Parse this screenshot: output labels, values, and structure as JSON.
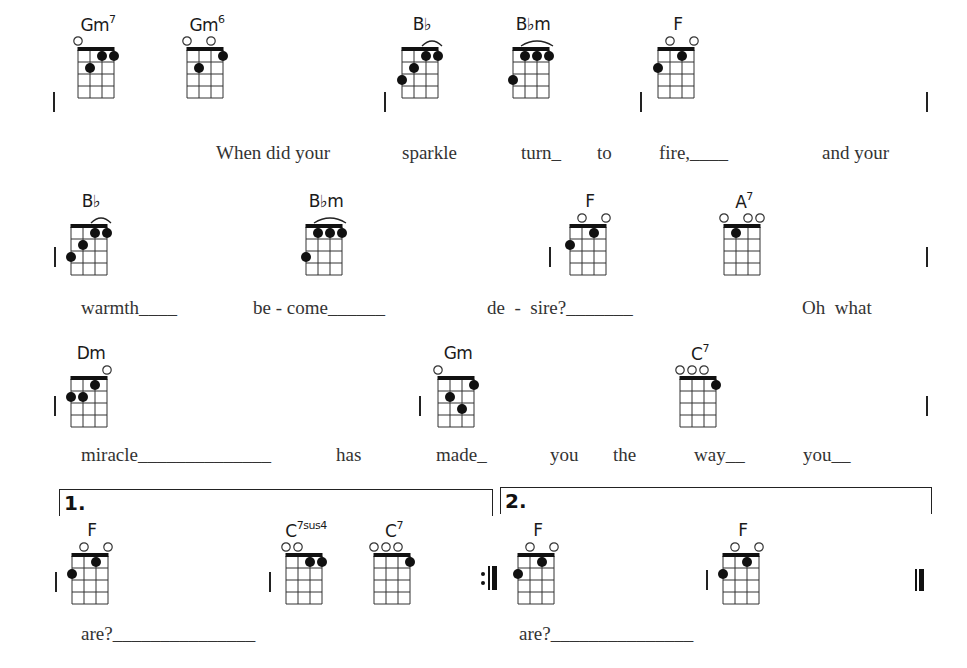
{
  "strings": [
    "G",
    "C",
    "E",
    "A"
  ],
  "chords": [
    {
      "id": "c1",
      "name": "Gm",
      "sup": "7",
      "x": 68,
      "y": 14,
      "frets": [
        0,
        2,
        1,
        1
      ],
      "arc": null
    },
    {
      "id": "c2",
      "name": "Gm",
      "sup": "6",
      "x": 177,
      "y": 14,
      "frets": [
        0,
        2,
        0,
        1
      ],
      "arc": null
    },
    {
      "id": "c3",
      "name": "B♭",
      "sup": "",
      "x": 392,
      "y": 14,
      "frets": [
        3,
        2,
        1,
        1
      ],
      "arc": [
        2,
        3
      ]
    },
    {
      "id": "c4",
      "name": "B♭m",
      "sup": "",
      "x": 503,
      "y": 14,
      "frets": [
        3,
        1,
        1,
        1
      ],
      "arc": [
        1,
        3
      ]
    },
    {
      "id": "c5",
      "name": "F",
      "sup": "",
      "x": 648,
      "y": 14,
      "frets": [
        2,
        0,
        1,
        0
      ],
      "arc": null
    },
    {
      "id": "c6",
      "name": "B♭",
      "sup": "",
      "x": 61,
      "y": 191,
      "frets": [
        3,
        2,
        1,
        1
      ],
      "arc": [
        2,
        3
      ]
    },
    {
      "id": "c7",
      "name": "B♭m",
      "sup": "",
      "x": 296,
      "y": 191,
      "frets": [
        3,
        1,
        1,
        1
      ],
      "arc": [
        1,
        3
      ]
    },
    {
      "id": "c8",
      "name": "F",
      "sup": "",
      "x": 560,
      "y": 191,
      "frets": [
        2,
        0,
        1,
        0
      ],
      "arc": null
    },
    {
      "id": "c9",
      "name": "A",
      "sup": "7",
      "x": 714,
      "y": 191,
      "frets": [
        0,
        1,
        0,
        0
      ],
      "arc": null
    },
    {
      "id": "c10",
      "name": "Dm",
      "sup": "",
      "x": 61,
      "y": 343,
      "frets": [
        2,
        2,
        1,
        0
      ],
      "arc": null
    },
    {
      "id": "c11",
      "name": "Gm",
      "sup": "",
      "x": 428,
      "y": 343,
      "frets": [
        0,
        2,
        3,
        1
      ],
      "arc": null
    },
    {
      "id": "c12",
      "name": "C",
      "sup": "7",
      "x": 670,
      "y": 343,
      "frets": [
        0,
        0,
        0,
        1
      ],
      "arc": null
    },
    {
      "id": "c13",
      "name": "F",
      "sup": "",
      "x": 62,
      "y": 520,
      "frets": [
        2,
        0,
        1,
        0
      ],
      "arc": null
    },
    {
      "id": "c14",
      "name": "C",
      "sup": "7sus4",
      "x": 276,
      "y": 520,
      "frets": [
        0,
        0,
        1,
        1
      ],
      "arc": null
    },
    {
      "id": "c15",
      "name": "C",
      "sup": "7",
      "x": 364,
      "y": 520,
      "frets": [
        0,
        0,
        0,
        1
      ],
      "arc": null
    },
    {
      "id": "c16",
      "name": "F",
      "sup": "",
      "x": 508,
      "y": 520,
      "frets": [
        2,
        0,
        1,
        0
      ],
      "arc": null
    },
    {
      "id": "c17",
      "name": "F",
      "sup": "",
      "x": 713,
      "y": 520,
      "frets": [
        2,
        0,
        1,
        0
      ],
      "arc": null
    }
  ],
  "lyrics": {
    "line1": [
      {
        "text": "When did your",
        "x": 216,
        "y": 142
      },
      {
        "text": "sparkle",
        "x": 402,
        "y": 142
      },
      {
        "text": "turn_",
        "x": 521,
        "y": 142
      },
      {
        "text": "to",
        "x": 597,
        "y": 142
      },
      {
        "text": "fire,____",
        "x": 659,
        "y": 142
      },
      {
        "text": "and your",
        "x": 822,
        "y": 142
      }
    ],
    "line2": [
      {
        "text": "warmth____",
        "x": 81,
        "y": 297
      },
      {
        "text": "be - come______",
        "x": 253,
        "y": 297
      },
      {
        "text": "de  -  sire?_______",
        "x": 487,
        "y": 297
      },
      {
        "text": "Oh  what",
        "x": 802,
        "y": 297
      }
    ],
    "line3": [
      {
        "text": "miracle______________",
        "x": 81,
        "y": 444
      },
      {
        "text": "has",
        "x": 336,
        "y": 444
      },
      {
        "text": "made_",
        "x": 436,
        "y": 444
      },
      {
        "text": "you",
        "x": 550,
        "y": 444
      },
      {
        "text": "the",
        "x": 613,
        "y": 444
      },
      {
        "text": "way__",
        "x": 694,
        "y": 444
      },
      {
        "text": "you__",
        "x": 803,
        "y": 444
      }
    ],
    "line4": [
      {
        "text": "are?_______________",
        "x": 81,
        "y": 623
      },
      {
        "text": "are?_______________",
        "x": 519,
        "y": 623
      }
    ]
  },
  "barlines": [
    {
      "x": 53,
      "y": 92
    },
    {
      "x": 384,
      "y": 92
    },
    {
      "x": 640,
      "y": 92
    },
    {
      "x": 926,
      "y": 92
    },
    {
      "x": 54,
      "y": 247
    },
    {
      "x": 549,
      "y": 247
    },
    {
      "x": 926,
      "y": 247
    },
    {
      "x": 54,
      "y": 396
    },
    {
      "x": 419,
      "y": 396
    },
    {
      "x": 926,
      "y": 396
    },
    {
      "x": 55,
      "y": 572
    },
    {
      "x": 269,
      "y": 572
    },
    {
      "x": 706,
      "y": 570
    }
  ],
  "voltas": [
    {
      "label": "1.",
      "x": 59,
      "y": 489,
      "w": 432
    },
    {
      "label": "2.",
      "x": 500,
      "y": 487,
      "w": 430
    }
  ],
  "repeat_sign": ":‖",
  "final_barline": "‖"
}
